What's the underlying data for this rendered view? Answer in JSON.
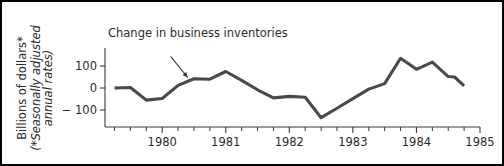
{
  "figure": {
    "frame_color": "#000000",
    "background": "#ffffff"
  },
  "axis_titles": {
    "y_main": "Billions of dollars*",
    "y_sub_line1": "(*Seasonally adjusted",
    "y_sub_line2": "annual rates)"
  },
  "annotation": {
    "text": "Change in business inventories"
  },
  "chart_data": {
    "type": "line",
    "title": "",
    "subtitle": "",
    "xlabel": "",
    "ylabel": "Billions of dollars* (*Seasonally adjusted annual rates)",
    "series_name": "Change in business inventories",
    "line_color": "#4a4a4a",
    "grid": false,
    "legend": "none",
    "annotations": [
      {
        "text": "Change in business inventories",
        "points_to_x": 1980.4,
        "points_to_y": 48
      }
    ],
    "xlim": [
      1979.1,
      1985.0
    ],
    "ylim": [
      -160,
      150
    ],
    "xticks": [
      1980,
      1981,
      1982,
      1983,
      1984,
      1985
    ],
    "xtick_labels": [
      "1980",
      "1981",
      "1982",
      "1983",
      "1984",
      "1985"
    ],
    "xminor_step": 0.25,
    "yticks": [
      100,
      0,
      -100
    ],
    "ytick_labels": [
      "100",
      "0",
      "− 100"
    ],
    "x": [
      1979.25,
      1979.5,
      1979.75,
      1980.0,
      1980.25,
      1980.5,
      1980.75,
      1981.0,
      1981.25,
      1981.5,
      1981.75,
      1982.0,
      1982.25,
      1982.5,
      1982.75,
      1983.0,
      1983.25,
      1983.5,
      1983.75,
      1984.0,
      1984.25,
      1984.5
    ],
    "values": [
      0,
      2,
      -55,
      -48,
      12,
      42,
      40,
      75,
      35,
      -8,
      -45,
      -38,
      -42,
      -135,
      -92,
      -48,
      -5,
      20,
      135,
      85,
      118,
      52
    ],
    "x_extra": [
      1984.6,
      1984.75
    ],
    "values_extra": [
      50,
      10
    ]
  }
}
